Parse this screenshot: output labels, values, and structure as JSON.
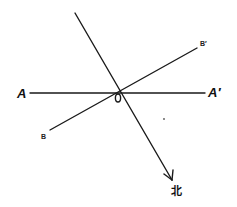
{
  "diagram": {
    "title": "",
    "colors": {
      "background": "#ffffff",
      "ink": "#1a1a1a"
    },
    "lines": [
      {
        "id": "AA'",
        "from": [
          30,
          93
        ],
        "to": [
          205,
          93
        ],
        "kind": "segment"
      },
      {
        "id": "BB'",
        "from": [
          50,
          130
        ],
        "to": [
          197,
          48
        ],
        "kind": "segment"
      },
      {
        "id": "north-arrow",
        "from": [
          75,
          13
        ],
        "to": [
          172,
          180
        ],
        "kind": "arrow"
      }
    ],
    "labels": {
      "A": "A",
      "A_prime": "A′",
      "B": "B",
      "B_prime": "B′",
      "O": "O",
      "north": "北"
    },
    "intersection_point": {
      "name": "O",
      "x": 119,
      "y": 93
    }
  }
}
